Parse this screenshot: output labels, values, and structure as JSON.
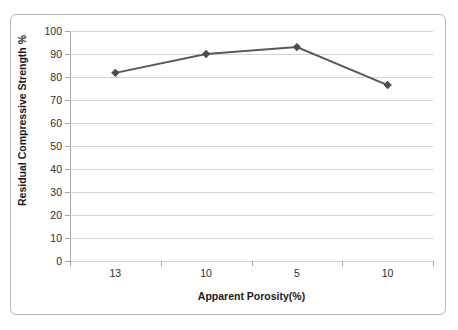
{
  "chart_data": {
    "type": "line",
    "title": "",
    "xlabel": "Apparent Porosity(%)",
    "ylabel": "Residual Compressive Strength %",
    "categories": [
      "13",
      "10",
      "5",
      "10"
    ],
    "values": [
      81.8,
      90.0,
      93.0,
      76.5
    ],
    "series": [
      {
        "name": "Residual Compressive Strength %",
        "values": [
          81.8,
          90.0,
          93.0,
          76.5
        ],
        "color": "#595959",
        "marker": "diamond"
      }
    ],
    "ylim": [
      0,
      100
    ],
    "ytick_labels": [
      "100",
      "90",
      "80",
      "70",
      "60",
      "50",
      "40",
      "30",
      "20",
      "10",
      "0"
    ],
    "ytick_values": [
      100,
      90,
      80,
      70,
      60,
      50,
      40,
      30,
      20,
      10,
      0
    ],
    "ytick_step": 10,
    "grid": true,
    "grid_axis": "y",
    "legend": false,
    "legend_position": "none",
    "colors": {
      "line": "#595959",
      "marker": "#4d4d4d",
      "gridline": "#d4d4d4",
      "axis": "#a6a6a6",
      "frame": "#b8b8b8",
      "text": "#2e2e2e",
      "background": "#ffffff"
    }
  }
}
